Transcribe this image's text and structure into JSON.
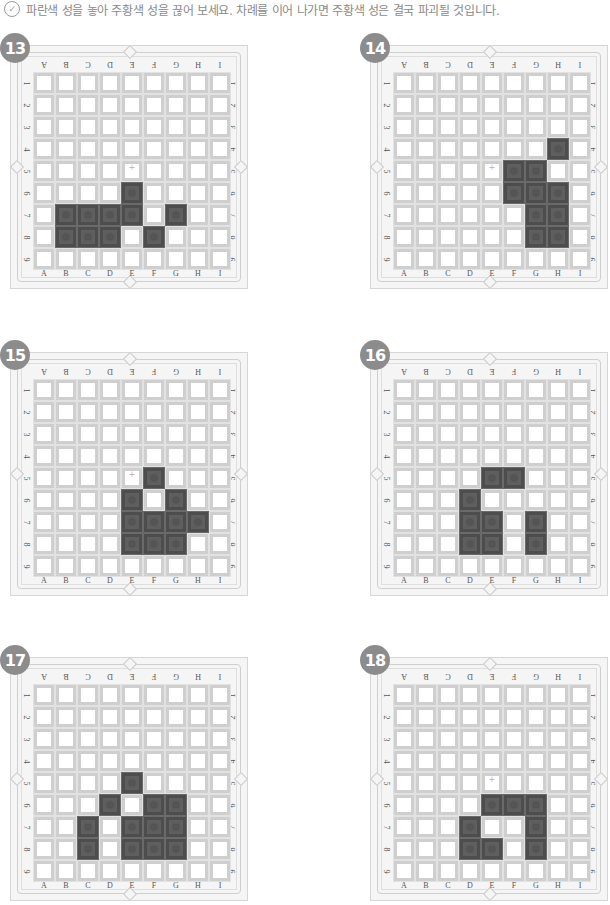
{
  "instruction": {
    "icon": "check-circle-icon",
    "icon_glyph": "✓",
    "text": "파란색 성을 놓아 주황색 성을 끊어 보세요. 차례를 이어 나가면 주황색 성은 결국 파괴될 것입니다."
  },
  "board": {
    "columns": [
      "A",
      "B",
      "C",
      "D",
      "E",
      "F",
      "G",
      "H",
      "I"
    ],
    "rows": [
      "1",
      "2",
      "3",
      "4",
      "5",
      "6",
      "7",
      "8",
      "9"
    ],
    "center_cell": "E5"
  },
  "puzzles": [
    {
      "number": "13",
      "stones": [
        "E6",
        "B7",
        "C7",
        "D7",
        "E7",
        "G7",
        "B8",
        "C8",
        "D8",
        "F8"
      ]
    },
    {
      "number": "14",
      "stones": [
        "H4",
        "F5",
        "G5",
        "F6",
        "G6",
        "H6",
        "G7",
        "H7",
        "G8",
        "H8"
      ]
    },
    {
      "number": "15",
      "stones": [
        "F5",
        "E6",
        "G6",
        "E7",
        "F7",
        "G7",
        "H7",
        "E8",
        "F8",
        "G8"
      ]
    },
    {
      "number": "16",
      "stones": [
        "E5",
        "F5",
        "D6",
        "D7",
        "E7",
        "G7",
        "D8",
        "E8",
        "G8"
      ]
    },
    {
      "number": "17",
      "stones": [
        "E5",
        "D6",
        "F6",
        "G6",
        "C7",
        "E7",
        "F7",
        "G7",
        "C8",
        "E8",
        "F8",
        "G8"
      ]
    },
    {
      "number": "18",
      "stones": [
        "E6",
        "F6",
        "G6",
        "D7",
        "G7",
        "D8",
        "E8",
        "G8"
      ]
    }
  ],
  "colors": {
    "badge": "#8c8c8c",
    "stone": "#5f5f5f",
    "instruction_text": "#8a8a8a"
  }
}
